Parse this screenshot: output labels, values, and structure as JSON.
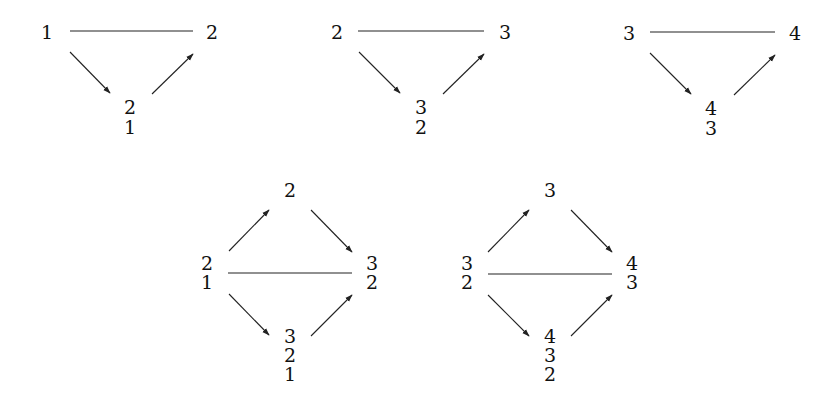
{
  "diagrams": [
    {
      "id": "triangle-1-2",
      "left": "1",
      "right": "2",
      "bottom_stack": [
        "2",
        "1"
      ]
    },
    {
      "id": "triangle-2-3",
      "left": "2",
      "right": "3",
      "bottom_stack": [
        "3",
        "2"
      ]
    },
    {
      "id": "triangle-3-4",
      "left": "3",
      "right": "4",
      "bottom_stack": [
        "4",
        "3"
      ]
    },
    {
      "id": "diamond-1",
      "top": "2",
      "left_stack": [
        "2",
        "1"
      ],
      "right_stack": [
        "3",
        "2"
      ],
      "bottom_stack": [
        "3",
        "2",
        "1"
      ]
    },
    {
      "id": "diamond-2",
      "top": "3",
      "left_stack": [
        "3",
        "2"
      ],
      "right_stack": [
        "4",
        "3"
      ],
      "bottom_stack": [
        "4",
        "3",
        "2"
      ]
    }
  ],
  "colors": {
    "ink": "#111111",
    "background": "#ffffff"
  }
}
